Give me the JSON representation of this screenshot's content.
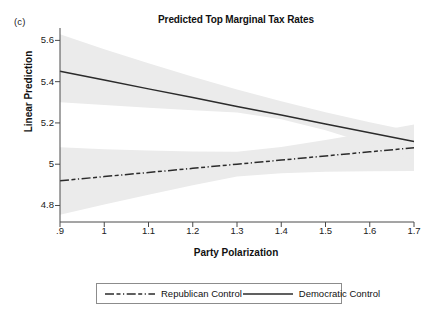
{
  "panel": {
    "tag": "(c)"
  },
  "chart_data": {
    "type": "line",
    "title": "Predicted Top Marginal Tax Rates",
    "xlabel": "Party Polarization",
    "ylabel": "Linear Prediction",
    "xlim": [
      0.9,
      1.7
    ],
    "ylim": [
      4.72,
      5.66
    ],
    "xticks": [
      0.9,
      1.0,
      1.1,
      1.2,
      1.3,
      1.4,
      1.5,
      1.6,
      1.7
    ],
    "xtick_labels": [
      ".9",
      "1",
      "1.1",
      "1.2",
      "1.3",
      "1.4",
      "1.5",
      "1.6",
      "1.7"
    ],
    "yticks": [
      5.6,
      5.4,
      5.2,
      5.0,
      4.8
    ],
    "ytick_labels": [
      "5.6",
      "5.4",
      "5.2",
      "5",
      "4.8"
    ],
    "grid": false,
    "legend_position": "below-center",
    "band_color": "#ebebeb",
    "line_color": "#2b2b2b",
    "series": [
      {
        "name": "Republican Control",
        "style": "dash-dot",
        "x": [
          0.9,
          1.0,
          1.1,
          1.2,
          1.3,
          1.4,
          1.5,
          1.6,
          1.7
        ],
        "values": [
          4.92,
          4.94,
          4.96,
          4.98,
          5.0,
          5.02,
          5.04,
          5.06,
          5.08
        ],
        "ci_lower": [
          4.755,
          4.805,
          4.852,
          4.898,
          4.94,
          4.956,
          4.963,
          4.966,
          4.967
        ],
        "ci_upper": [
          5.082,
          5.073,
          5.066,
          5.061,
          5.06,
          5.083,
          5.117,
          5.154,
          5.193
        ]
      },
      {
        "name": "Democratic Control",
        "style": "solid",
        "x": [
          0.9,
          1.0,
          1.1,
          1.2,
          1.3,
          1.4,
          1.5,
          1.6,
          1.7
        ],
        "values": [
          5.45,
          5.408,
          5.365,
          5.323,
          5.28,
          5.238,
          5.195,
          5.153,
          5.11
        ],
        "ci_lower": [
          5.3,
          5.287,
          5.274,
          5.262,
          5.25,
          5.218,
          5.165,
          5.098,
          5.022
        ],
        "ci_upper": [
          5.63,
          5.557,
          5.489,
          5.424,
          5.362,
          5.305,
          5.252,
          5.203,
          5.158
        ]
      }
    ]
  },
  "legend": {
    "items": [
      {
        "label": "Republican Control",
        "style": "dash-dot"
      },
      {
        "label": "Democratic Control",
        "style": "solid"
      }
    ]
  }
}
